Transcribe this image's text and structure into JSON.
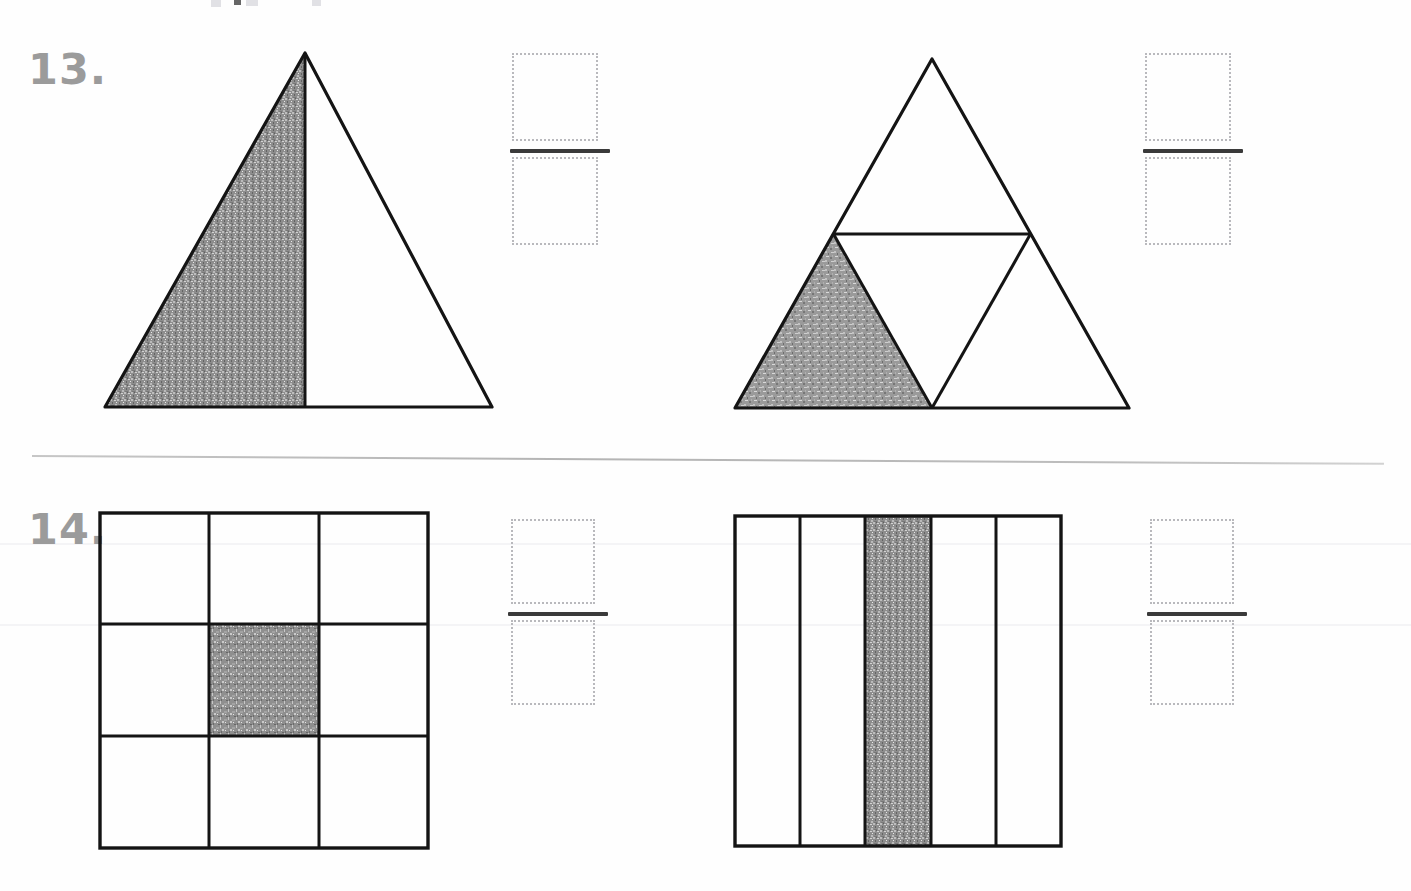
{
  "page": {
    "width": 1411,
    "height": 891,
    "background": "#fefefe",
    "ink_color": "#1a1a1a",
    "number_color": "#9b9b9b",
    "answer_box_color": "#b9b9bd",
    "fraction_bar_color": "#3a3a3a",
    "shade_color": "#8a8a8a"
  },
  "problems": [
    {
      "id": "problem-13",
      "number_label": "13.",
      "separator_below": true,
      "figures": [
        {
          "id": "figure-13-left",
          "shape": "triangle",
          "description": "Triangle split into 2 equal parts by a vertical line from apex to base midpoint",
          "total_parts": 2,
          "shaded_parts": 1,
          "shaded_region": "left",
          "fraction_shaded": "1/2"
        },
        {
          "id": "figure-13-right",
          "shape": "triangle",
          "description": "Equilateral triangle split into 4 congruent smaller triangles by midsegments",
          "total_parts": 4,
          "shaded_parts": 1,
          "shaded_region": "bottom-left",
          "fraction_shaded": "1/4"
        }
      ],
      "answers": [
        {
          "id": "answer-13-left",
          "numerator": "",
          "denominator": "",
          "numerator_placeholder": "",
          "denominator_placeholder": ""
        },
        {
          "id": "answer-13-right",
          "numerator": "",
          "denominator": "",
          "numerator_placeholder": "",
          "denominator_placeholder": ""
        }
      ]
    },
    {
      "id": "problem-14",
      "number_label": "14.",
      "separator_below": false,
      "figures": [
        {
          "id": "figure-14-left",
          "shape": "square-grid",
          "description": "Square divided into a 3 by 3 grid of equal cells",
          "rows": 3,
          "columns": 3,
          "total_parts": 9,
          "shaded_parts": 1,
          "shaded_region": "center",
          "shaded_cells": [
            [
              1,
              1
            ]
          ],
          "fraction_shaded": "1/9"
        },
        {
          "id": "figure-14-right",
          "shape": "rectangle-strips",
          "description": "Rectangle divided into 5 equal vertical strips",
          "total_parts": 5,
          "shaded_parts": 1,
          "shaded_region": "middle-strip",
          "shaded_strips": [
            2
          ],
          "fraction_shaded": "1/5"
        }
      ],
      "answers": [
        {
          "id": "answer-14-left",
          "numerator": "",
          "denominator": "",
          "numerator_placeholder": "",
          "denominator_placeholder": ""
        },
        {
          "id": "answer-14-right",
          "numerator": "",
          "denominator": "",
          "numerator_placeholder": "",
          "denominator_placeholder": ""
        }
      ]
    }
  ]
}
